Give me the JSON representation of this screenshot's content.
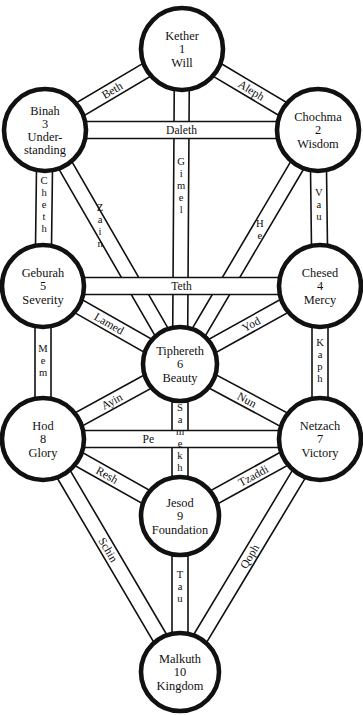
{
  "diagram": {
    "background": "#ffffff",
    "ink": "#111111"
  },
  "sephiroth": [
    {
      "id": "kether",
      "name": "Kether",
      "number": "1",
      "title": "Will",
      "cx": 182,
      "cy": 49,
      "r": 41,
      "lines": [
        "Kether",
        "1",
        "Will"
      ]
    },
    {
      "id": "binah",
      "name": "Binah",
      "number": "3",
      "title": "Under-standing",
      "cx": 45,
      "cy": 130,
      "r": 41,
      "lines": [
        "Binah",
        "3",
        "Under-",
        "standing"
      ]
    },
    {
      "id": "chochma",
      "name": "Chochma",
      "number": "2",
      "title": "Wisdom",
      "cx": 318,
      "cy": 130,
      "r": 41,
      "lines": [
        "Chochma",
        "2",
        "Wisdom"
      ]
    },
    {
      "id": "geburah",
      "name": "Geburah",
      "number": "5",
      "title": "Severity",
      "cx": 43,
      "cy": 286,
      "r": 41,
      "lines": [
        "Geburah",
        "5",
        "Severity"
      ]
    },
    {
      "id": "chesed",
      "name": "Chesed",
      "number": "4",
      "title": "Mercy",
      "cx": 320,
      "cy": 286,
      "r": 41,
      "lines": [
        "Chesed",
        "4",
        "Mercy"
      ]
    },
    {
      "id": "tiphereth",
      "name": "Tiphereth",
      "number": "6",
      "title": "Beauty",
      "cx": 180,
      "cy": 364,
      "r": 37,
      "lines": [
        "Tiphereth",
        "6",
        "Beauty"
      ]
    },
    {
      "id": "hod",
      "name": "Hod",
      "number": "8",
      "title": "Glory",
      "cx": 43,
      "cy": 439,
      "r": 41,
      "lines": [
        "Hod",
        "8",
        "Glory"
      ]
    },
    {
      "id": "netzach",
      "name": "Netzach",
      "number": "7",
      "title": "Victory",
      "cx": 320,
      "cy": 439,
      "r": 41,
      "lines": [
        "Netzach",
        "7",
        "Victory"
      ]
    },
    {
      "id": "jesod",
      "name": "Jesod",
      "number": "9",
      "title": "Foundation",
      "cx": 180,
      "cy": 516,
      "r": 39,
      "lines": [
        "Jesod",
        "9",
        "Foundation"
      ]
    },
    {
      "id": "malkuth",
      "name": "Malkuth",
      "number": "10",
      "title": "Kingdom",
      "cx": 180,
      "cy": 672,
      "r": 39,
      "lines": [
        "Malkuth",
        "10",
        "Kingdom"
      ]
    }
  ],
  "paths": [
    {
      "id": "aleph",
      "label": "Aleph",
      "from": "kether",
      "to": "chochma",
      "style": "along",
      "width": 15,
      "label_pos": 0.52
    },
    {
      "id": "beth",
      "label": "Beth",
      "from": "kether",
      "to": "binah",
      "style": "along",
      "width": 15,
      "label_pos": 0.52
    },
    {
      "id": "gimel",
      "label": "Gimel",
      "from": "kether",
      "to": "tiphereth",
      "style": "stack",
      "width": 15,
      "label_pos": 0.4
    },
    {
      "id": "daleth",
      "label": "Daleth",
      "from": "binah",
      "to": "chochma",
      "style": "along",
      "width": 17,
      "label_pos": 0.5
    },
    {
      "id": "he",
      "label": "He",
      "from": "chochma",
      "to": "tiphereth",
      "style": "stack",
      "width": 15,
      "label_pos": 0.38
    },
    {
      "id": "vau",
      "label": "Vau",
      "from": "chochma",
      "to": "chesed",
      "style": "stack",
      "width": 16,
      "label_pos": 0.45
    },
    {
      "id": "zain",
      "label": "Zain",
      "from": "binah",
      "to": "tiphereth",
      "style": "stack",
      "width": 15,
      "label_pos": 0.36
    },
    {
      "id": "cheth",
      "label": "Cheth",
      "from": "binah",
      "to": "geburah",
      "style": "stack",
      "width": 16,
      "label_pos": 0.45
    },
    {
      "id": "teth",
      "label": "Teth",
      "from": "geburah",
      "to": "chesed",
      "style": "along",
      "width": 17,
      "label_pos": 0.5
    },
    {
      "id": "yod",
      "label": "Yod",
      "from": "chesed",
      "to": "tiphereth",
      "style": "along",
      "width": 15,
      "label_pos": 0.46
    },
    {
      "id": "kaph",
      "label": "Kaph",
      "from": "chesed",
      "to": "netzach",
      "style": "stack",
      "width": 16,
      "label_pos": 0.47
    },
    {
      "id": "lamed",
      "label": "Lamed",
      "from": "geburah",
      "to": "tiphereth",
      "style": "along",
      "width": 15,
      "label_pos": 0.44
    },
    {
      "id": "mem",
      "label": "Mem",
      "from": "geburah",
      "to": "hod",
      "style": "stack",
      "width": 16,
      "label_pos": 0.47
    },
    {
      "id": "nun",
      "label": "Nun",
      "from": "tiphereth",
      "to": "netzach",
      "style": "along",
      "width": 15,
      "label_pos": 0.48
    },
    {
      "id": "samekh",
      "label": "Samekh",
      "from": "tiphereth",
      "to": "jesod",
      "style": "stack",
      "width": 16,
      "label_pos": 0.48
    },
    {
      "id": "ayin",
      "label": "Ayin",
      "from": "tiphereth",
      "to": "hod",
      "style": "along",
      "width": 15,
      "label_pos": 0.52
    },
    {
      "id": "pe",
      "label": "Pe",
      "from": "hod",
      "to": "netzach",
      "style": "along",
      "width": 17,
      "label_pos": 0.33
    },
    {
      "id": "tzaddi",
      "label": "Tzaddi",
      "from": "netzach",
      "to": "jesod",
      "style": "along",
      "width": 15,
      "label_pos": 0.44
    },
    {
      "id": "qoph",
      "label": "Qoph",
      "from": "netzach",
      "to": "malkuth",
      "style": "along",
      "width": 15,
      "label_pos": 0.5
    },
    {
      "id": "resh",
      "label": "Resh",
      "from": "hod",
      "to": "jesod",
      "style": "along",
      "width": 15,
      "label_pos": 0.42
    },
    {
      "id": "schin",
      "label": "Schin",
      "from": "hod",
      "to": "malkuth",
      "style": "along",
      "width": 15,
      "label_pos": 0.46
    },
    {
      "id": "tau",
      "label": "Tau",
      "from": "jesod",
      "to": "malkuth",
      "style": "stack",
      "width": 16,
      "label_pos": 0.4
    }
  ]
}
